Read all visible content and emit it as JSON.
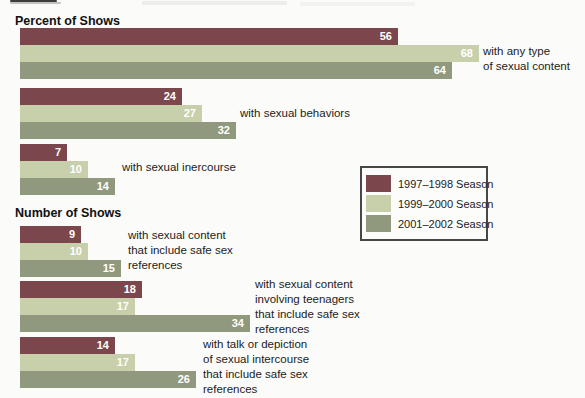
{
  "headings": {
    "percent": "Percent of Shows",
    "number": "Number of Shows"
  },
  "legend": {
    "items": [
      {
        "label": "1997–1998 Season",
        "color": "#7c474c"
      },
      {
        "label": "1999–2000 Season",
        "color": "#c8cfab"
      },
      {
        "label": "2001–2002 Season",
        "color": "#90997e"
      }
    ]
  },
  "chart_data": {
    "type": "bar",
    "orientation": "horizontal",
    "series": [
      "1997–1998 Season",
      "1999–2000 Season",
      "2001–2002 Season"
    ],
    "series_colors": [
      "#7c474c",
      "#c8cfab",
      "#90997e"
    ],
    "xlim": [
      0,
      70
    ],
    "grid": false,
    "legend_position": "middle-right",
    "sections": [
      {
        "heading": "Percent of Shows",
        "groups": [
          {
            "label": "with any type of sexual content",
            "label_lines": [
              "with any type",
              "of sexual content"
            ],
            "values": [
              56,
              68,
              64
            ]
          },
          {
            "label": "with sexual behaviors",
            "label_lines": [
              "with sexual behaviors"
            ],
            "values": [
              24,
              27,
              32
            ]
          },
          {
            "label": "with sexual inercourse",
            "label_lines": [
              "with sexual inercourse"
            ],
            "values": [
              7,
              10,
              14
            ]
          }
        ]
      },
      {
        "heading": "Number of Shows",
        "groups": [
          {
            "label": "with sexual content that include safe sex references",
            "label_lines": [
              "with sexual content",
              "that include safe sex",
              "references"
            ],
            "values": [
              9,
              10,
              15
            ]
          },
          {
            "label": "with sexual content involving teenagers that include safe sex references",
            "label_lines": [
              "with sexual content",
              "involving teenagers",
              "that include safe sex",
              "references"
            ],
            "values": [
              18,
              17,
              34
            ]
          },
          {
            "label": "with talk or depiction of sexual intercourse that include safe sex references",
            "label_lines": [
              "with talk or depiction",
              "of sexual intercourse",
              "that include safe sex",
              "references"
            ],
            "values": [
              14,
              17,
              26
            ]
          }
        ]
      }
    ]
  }
}
